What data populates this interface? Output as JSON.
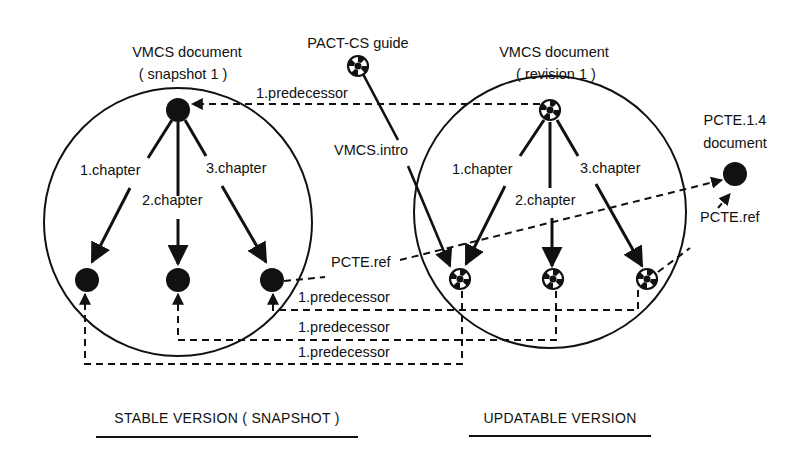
{
  "diagram": {
    "stable": {
      "title_line1": "VMCS document",
      "title_line2": "( snapshot 1 )",
      "edges": [
        "1.chapter",
        "2.chapter",
        "3.chapter"
      ],
      "footer": "STABLE VERSION ( SNAPSHOT )"
    },
    "updatable": {
      "title_line1": "VMCS document",
      "title_line2": "( revision 1 )",
      "edges": [
        "1.chapter",
        "2.chapter",
        "3.chapter"
      ],
      "footer": "UPDATABLE VERSION"
    },
    "guide": {
      "title": "PACT-CS guide",
      "edge": "VMCS.intro"
    },
    "external": {
      "title_line1": "PCTE.1.4",
      "title_line2": "document",
      "edge_from_stable": "PCTE.ref",
      "edge_from_updatable": "PCTE.ref"
    },
    "predecessor_links": [
      "1.predecessor",
      "1.predecessor",
      "1.predecessor",
      "1.predecessor"
    ],
    "legend": {
      "solid_node": "stable object",
      "checkered_node": "updatable object"
    },
    "colors": {
      "ink": "#111111",
      "background": "#ffffff"
    }
  }
}
